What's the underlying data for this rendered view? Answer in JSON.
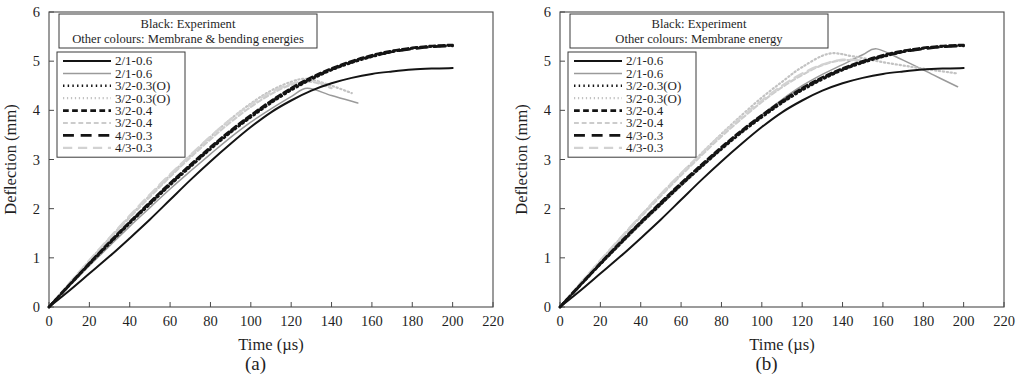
{
  "figure": {
    "panels": [
      {
        "caption": "(a)",
        "header": {
          "line1": "Black: Experiment",
          "line2": "Other colours: Membrane & bending energies"
        },
        "axes": {
          "xlabel": "Time (µs)",
          "ylabel": "Deflection (mm)",
          "xticks": [
            0,
            20,
            40,
            60,
            80,
            100,
            120,
            140,
            160,
            180,
            200,
            220
          ],
          "yticks": [
            0,
            1,
            2,
            3,
            4,
            5,
            6
          ],
          "xlim": [
            0,
            220
          ],
          "ylim": [
            0,
            6
          ]
        },
        "legend": [
          {
            "label": "2/1-0.6",
            "style": "solid",
            "color": "#141414",
            "width": 2.0
          },
          {
            "label": "2/1-0.6",
            "style": "solid",
            "color": "#9a9a9a",
            "width": 1.5
          },
          {
            "label": "3/2-0.3(O)",
            "style": "dotted",
            "color": "#141414",
            "width": 2.6
          },
          {
            "label": "3/2-0.3(O)",
            "style": "dotted",
            "color": "#c2c2c2",
            "width": 2.2
          },
          {
            "label": "3/2-0.4",
            "style": "shortdash",
            "color": "#141414",
            "width": 2.6
          },
          {
            "label": "3/2-0.4",
            "style": "shortdash",
            "color": "#cccccc",
            "width": 2.2
          },
          {
            "label": "4/3-0.3",
            "style": "longdash",
            "color": "#141414",
            "width": 2.6
          },
          {
            "label": "4/3-0.3",
            "style": "longdash",
            "color": "#d2d2d2",
            "width": 2.2
          }
        ]
      },
      {
        "caption": "(b)",
        "header": {
          "line1": "Black: Experiment",
          "line2": "Other colours: Membrane energy"
        },
        "axes": {
          "xlabel": "Time (µs)",
          "ylabel": "Deflection (mm)",
          "xticks": [
            0,
            20,
            40,
            60,
            80,
            100,
            120,
            140,
            160,
            180,
            200,
            220
          ],
          "yticks": [
            0,
            1,
            2,
            3,
            4,
            5,
            6
          ],
          "xlim": [
            0,
            220
          ],
          "ylim": [
            0,
            6
          ]
        },
        "legend": [
          {
            "label": "2/1-0.6",
            "style": "solid",
            "color": "#141414",
            "width": 2.0
          },
          {
            "label": "2/1-0.6",
            "style": "solid",
            "color": "#9a9a9a",
            "width": 1.5
          },
          {
            "label": "3/2-0.3(O)",
            "style": "dotted",
            "color": "#141414",
            "width": 2.6
          },
          {
            "label": "3/2-0.3(O)",
            "style": "dotted",
            "color": "#c2c2c2",
            "width": 2.2
          },
          {
            "label": "3/2-0.4",
            "style": "shortdash",
            "color": "#141414",
            "width": 2.6
          },
          {
            "label": "3/2-0.4",
            "style": "shortdash",
            "color": "#cccccc",
            "width": 2.2
          },
          {
            "label": "4/3-0.3",
            "style": "longdash",
            "color": "#141414",
            "width": 2.6
          },
          {
            "label": "4/3-0.3",
            "style": "longdash",
            "color": "#d2d2d2",
            "width": 2.2
          }
        ]
      }
    ]
  },
  "chart_data": [
    {
      "type": "line",
      "title": "(a) Membrane & bending energies",
      "xlabel": "Time (µs)",
      "ylabel": "Deflection (mm)",
      "xlim": [
        0,
        220
      ],
      "ylim": [
        0,
        6
      ],
      "xticks": [
        0,
        20,
        40,
        60,
        80,
        100,
        120,
        140,
        160,
        180,
        200,
        220
      ],
      "yticks": [
        0,
        1,
        2,
        3,
        4,
        5,
        6
      ],
      "grid": false,
      "legend_position": "upper-left",
      "annotations": [
        "Black: Experiment",
        "Other colours: Membrane & bending energies"
      ],
      "series": [
        {
          "name": "2/1-0.6 (experiment)",
          "style": "solid",
          "color": "#141414",
          "width": 2.0,
          "x": [
            0,
            10,
            20,
            30,
            40,
            50,
            60,
            70,
            80,
            90,
            100,
            110,
            120,
            130,
            140,
            150,
            160,
            170,
            180,
            190,
            200
          ],
          "y": [
            0.0,
            0.33,
            0.68,
            1.03,
            1.4,
            1.78,
            2.18,
            2.58,
            2.96,
            3.32,
            3.66,
            3.96,
            4.2,
            4.4,
            4.55,
            4.66,
            4.74,
            4.79,
            4.83,
            4.85,
            4.86
          ]
        },
        {
          "name": "2/1-0.6 (simulation)",
          "style": "solid",
          "color": "#9a9a9a",
          "width": 1.5,
          "x": [
            0,
            10,
            20,
            30,
            40,
            50,
            60,
            70,
            80,
            90,
            100,
            110,
            120,
            128,
            140,
            153
          ],
          "y": [
            0.0,
            0.42,
            0.84,
            1.24,
            1.64,
            2.02,
            2.4,
            2.76,
            3.11,
            3.45,
            3.76,
            4.03,
            4.28,
            4.45,
            4.3,
            4.15
          ]
        },
        {
          "name": "3/2-0.3(O) (dark)",
          "style": "dotted",
          "color": "#141414",
          "width": 2.6,
          "x": [
            0,
            10,
            20,
            30,
            40,
            50,
            60,
            70,
            80,
            90,
            100,
            110,
            120,
            130,
            140,
            150,
            160,
            170,
            180,
            190,
            200
          ],
          "y": [
            0.0,
            0.44,
            0.87,
            1.29,
            1.7,
            2.09,
            2.48,
            2.85,
            3.21,
            3.55,
            3.86,
            4.15,
            4.41,
            4.63,
            4.82,
            4.97,
            5.09,
            5.19,
            5.26,
            5.3,
            5.32
          ]
        },
        {
          "name": "3/2-0.3(O) (light)",
          "style": "dotted",
          "color": "#c2c2c2",
          "width": 2.2,
          "x": [
            0,
            10,
            20,
            30,
            40,
            50,
            60,
            70,
            80,
            90,
            100,
            110,
            120,
            128,
            140,
            150
          ],
          "y": [
            0.0,
            0.47,
            0.94,
            1.4,
            1.84,
            2.27,
            2.68,
            3.08,
            3.46,
            3.82,
            4.14,
            4.4,
            4.58,
            4.64,
            4.5,
            4.35
          ]
        },
        {
          "name": "3/2-0.4 (dark)",
          "style": "shortdash",
          "color": "#141414",
          "width": 2.6,
          "x": [
            0,
            10,
            20,
            30,
            40,
            50,
            60,
            70,
            80,
            90,
            100,
            110,
            120,
            130,
            140,
            150,
            160,
            170,
            180,
            190,
            200
          ],
          "y": [
            0.0,
            0.45,
            0.89,
            1.32,
            1.73,
            2.13,
            2.52,
            2.89,
            3.25,
            3.59,
            3.9,
            4.19,
            4.45,
            4.67,
            4.85,
            5.0,
            5.12,
            5.21,
            5.27,
            5.31,
            5.33
          ]
        },
        {
          "name": "3/2-0.4 (light)",
          "style": "shortdash",
          "color": "#cccccc",
          "width": 2.2,
          "x": [
            0,
            10,
            20,
            30,
            40,
            50,
            60,
            70,
            80,
            90,
            100,
            110,
            120,
            130,
            140
          ],
          "y": [
            0.0,
            0.47,
            0.93,
            1.38,
            1.82,
            2.24,
            2.65,
            3.04,
            3.41,
            3.76,
            4.07,
            4.33,
            4.52,
            4.58,
            4.45
          ]
        },
        {
          "name": "4/3-0.3 (dark)",
          "style": "longdash",
          "color": "#141414",
          "width": 2.6,
          "x": [
            0,
            10,
            20,
            30,
            40,
            50,
            60,
            70,
            80,
            90,
            100,
            110,
            120,
            130,
            140,
            150,
            160,
            170,
            180,
            190,
            200
          ],
          "y": [
            0.0,
            0.44,
            0.88,
            1.3,
            1.72,
            2.11,
            2.5,
            2.87,
            3.23,
            3.57,
            3.88,
            4.17,
            4.43,
            4.65,
            4.83,
            4.98,
            5.1,
            5.19,
            5.25,
            5.29,
            5.31
          ]
        },
        {
          "name": "4/3-0.3 (light)",
          "style": "longdash",
          "color": "#d2d2d2",
          "width": 2.2,
          "x": [
            0,
            10,
            20,
            30,
            40,
            50,
            60,
            70,
            80,
            90,
            100,
            110,
            120,
            130,
            140
          ],
          "y": [
            0.0,
            0.48,
            0.95,
            1.41,
            1.86,
            2.29,
            2.7,
            3.09,
            3.47,
            3.82,
            4.12,
            4.37,
            4.54,
            4.6,
            4.48
          ]
        }
      ]
    },
    {
      "type": "line",
      "title": "(b) Membrane energy",
      "xlabel": "Time (µs)",
      "ylabel": "Deflection (mm)",
      "xlim": [
        0,
        220
      ],
      "ylim": [
        0,
        6
      ],
      "xticks": [
        0,
        20,
        40,
        60,
        80,
        100,
        120,
        140,
        160,
        180,
        200,
        220
      ],
      "yticks": [
        0,
        1,
        2,
        3,
        4,
        5,
        6
      ],
      "grid": false,
      "legend_position": "upper-left",
      "annotations": [
        "Black: Experiment",
        "Other colours: Membrane energy"
      ],
      "series": [
        {
          "name": "2/1-0.6 (experiment)",
          "style": "solid",
          "color": "#141414",
          "width": 2.0,
          "x": [
            0,
            10,
            20,
            30,
            40,
            50,
            60,
            70,
            80,
            90,
            100,
            110,
            120,
            130,
            140,
            150,
            160,
            170,
            180,
            190,
            200
          ],
          "y": [
            0.0,
            0.33,
            0.68,
            1.03,
            1.4,
            1.78,
            2.18,
            2.58,
            2.96,
            3.32,
            3.66,
            3.96,
            4.2,
            4.4,
            4.55,
            4.66,
            4.74,
            4.79,
            4.83,
            4.85,
            4.86
          ]
        },
        {
          "name": "2/1-0.6 (simulation)",
          "style": "solid",
          "color": "#9a9a9a",
          "width": 1.5,
          "x": [
            0,
            10,
            20,
            30,
            40,
            50,
            60,
            70,
            80,
            90,
            100,
            110,
            120,
            130,
            140,
            150,
            157,
            170,
            185,
            197
          ],
          "y": [
            0.0,
            0.43,
            0.86,
            1.27,
            1.68,
            2.07,
            2.46,
            2.84,
            3.21,
            3.57,
            3.91,
            4.22,
            4.5,
            4.73,
            4.93,
            5.13,
            5.25,
            5.02,
            4.72,
            4.48
          ]
        },
        {
          "name": "3/2-0.3(O) (dark)",
          "style": "dotted",
          "color": "#141414",
          "width": 2.6,
          "x": [
            0,
            10,
            20,
            30,
            40,
            50,
            60,
            70,
            80,
            90,
            100,
            110,
            120,
            130,
            140,
            150,
            160,
            170,
            180,
            190,
            200
          ],
          "y": [
            0.0,
            0.44,
            0.87,
            1.29,
            1.7,
            2.09,
            2.48,
            2.85,
            3.21,
            3.55,
            3.86,
            4.15,
            4.41,
            4.63,
            4.82,
            4.97,
            5.09,
            5.19,
            5.26,
            5.3,
            5.32
          ]
        },
        {
          "name": "3/2-0.3(O) (light)",
          "style": "dotted",
          "color": "#c2c2c2",
          "width": 2.2,
          "x": [
            0,
            10,
            20,
            30,
            40,
            50,
            60,
            70,
            80,
            90,
            100,
            110,
            120,
            133,
            145,
            160,
            175,
            188,
            197
          ],
          "y": [
            0.0,
            0.47,
            0.94,
            1.4,
            1.85,
            2.29,
            2.71,
            3.12,
            3.52,
            3.9,
            4.26,
            4.58,
            4.88,
            5.15,
            5.1,
            4.98,
            4.88,
            4.8,
            4.75
          ]
        },
        {
          "name": "3/2-0.4 (dark)",
          "style": "shortdash",
          "color": "#141414",
          "width": 2.6,
          "x": [
            0,
            10,
            20,
            30,
            40,
            50,
            60,
            70,
            80,
            90,
            100,
            110,
            120,
            130,
            140,
            150,
            160,
            170,
            180,
            190,
            200
          ],
          "y": [
            0.0,
            0.45,
            0.89,
            1.32,
            1.73,
            2.13,
            2.52,
            2.89,
            3.25,
            3.59,
            3.9,
            4.19,
            4.45,
            4.67,
            4.85,
            5.0,
            5.12,
            5.21,
            5.27,
            5.31,
            5.33
          ]
        },
        {
          "name": "3/2-0.4 (light)",
          "style": "shortdash",
          "color": "#cccccc",
          "width": 2.2,
          "x": [
            0,
            10,
            20,
            30,
            40,
            50,
            60,
            70,
            80,
            90,
            100,
            110,
            120,
            130,
            140,
            150
          ],
          "y": [
            0.0,
            0.47,
            0.93,
            1.38,
            1.83,
            2.26,
            2.68,
            3.08,
            3.47,
            3.83,
            4.17,
            4.47,
            4.72,
            4.92,
            5.02,
            5.0
          ]
        },
        {
          "name": "4/3-0.3 (dark)",
          "style": "longdash",
          "color": "#141414",
          "width": 2.6,
          "x": [
            0,
            10,
            20,
            30,
            40,
            50,
            60,
            70,
            80,
            90,
            100,
            110,
            120,
            130,
            140,
            150,
            160,
            170,
            180,
            190,
            200
          ],
          "y": [
            0.0,
            0.44,
            0.88,
            1.3,
            1.72,
            2.11,
            2.5,
            2.87,
            3.23,
            3.57,
            3.88,
            4.17,
            4.43,
            4.65,
            4.83,
            4.98,
            5.1,
            5.19,
            5.25,
            5.29,
            5.31
          ]
        },
        {
          "name": "4/3-0.3 (light)",
          "style": "longdash",
          "color": "#d2d2d2",
          "width": 2.2,
          "x": [
            0,
            10,
            20,
            30,
            40,
            50,
            60,
            70,
            80,
            90,
            100,
            110,
            120,
            130,
            140,
            150
          ],
          "y": [
            0.0,
            0.48,
            0.95,
            1.41,
            1.86,
            2.3,
            2.72,
            3.12,
            3.51,
            3.87,
            4.2,
            4.5,
            4.75,
            4.93,
            5.03,
            5.01
          ]
        }
      ]
    }
  ]
}
